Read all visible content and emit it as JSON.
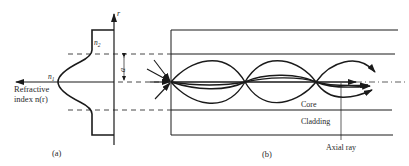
{
  "figure": {
    "panel_a": {
      "caption": "(a)",
      "axis_label_r": "r",
      "x_axis_label_line1": "Refractive",
      "x_axis_label_line2": "index n(r)",
      "n1_label": "n",
      "n1_sub": "1",
      "n2_label": "n",
      "n2_sub": "2",
      "radius_label": "a"
    },
    "panel_b": {
      "caption": "(b)",
      "core_label": "Core",
      "cladding_label": "Cladding",
      "axial_ray_label": "Axial ray"
    },
    "colors": {
      "ink": "#1a1a1a",
      "background": "#ffffff"
    }
  }
}
